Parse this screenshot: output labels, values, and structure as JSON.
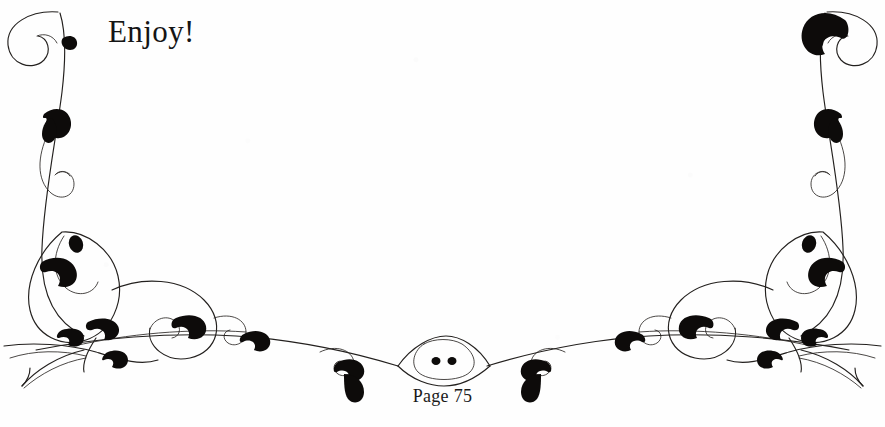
{
  "page": {
    "kind": "scanned-book-page-fragment",
    "background_color": "#fefefe",
    "ink_color": "#0d0b0a",
    "width_px": 885,
    "height_px": 427
  },
  "body_text": {
    "greeting": "Enjoy!"
  },
  "footer": {
    "page_label": "Page 75"
  },
  "ornament": {
    "name": "calligraphic-flourish",
    "description": "Mirror-symmetric pen-and-ink vine flourish framing the lower page, with spiral curls and solid teardrop leaves",
    "symmetry": "horizontal-mirror",
    "center_medallion_dots": 2,
    "stroke_color": "#23201e",
    "leaf_fill": "#0d0b0a"
  }
}
